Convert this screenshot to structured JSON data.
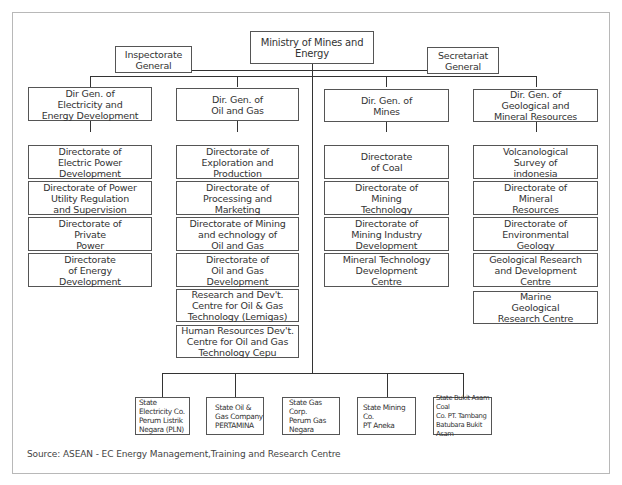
{
  "ministry": {
    "label": "Ministry of Mines and Energy"
  },
  "staff": {
    "inspectorate": "Inspectorate\nGeneral",
    "secretariat": "Secretariat\nGeneral"
  },
  "directorates_general": [
    {
      "label": "Dir Gen. of\nElectricity and\nEnergy Development",
      "units": [
        "Directorate of\nElectric Power\nDevelopment",
        "Directorate of Power\nUtility Regulation\nand Supervision",
        "Directorate of\nPrivate\nPower",
        "Directorate\nof Energy\nDevelopment"
      ]
    },
    {
      "label": "Dir. Gen. of\nOil and Gas",
      "units": [
        "Directorate of\nExploration and\nProduction",
        "Directorate of\nProcessing and\nMarketing",
        "Directorate of Mining\nand echnology of\nOil and Gas",
        "Directorate of\nOil and Gas\nDevelopment",
        "Research and Dev't.\nCentre for Oil & Gas\nTechnology (Lemigas)",
        "Human Resources Dev't.\nCentre for Oil and Gas\nTechnology Cepu"
      ]
    },
    {
      "label": "Dir. Gen. of\nMines",
      "units": [
        "Directorate\nof Coal",
        "Directorate of\nMining\nTechnology",
        "Directorate of\nMining Industry\nDevelopment",
        "Mineral Technology\nDevelopment\nCentre"
      ]
    },
    {
      "label": "Dir. Gen. of\nGeological and\nMineral Resources",
      "units": [
        "Volcanological\nSurvey of\nindonesia",
        "Directorate of\nMineral\nResources",
        "Directorate of\nEnvironmental\nGeology",
        "Geological Research\nand Development\nCentre",
        "Marine\nGeological\nResearch Centre"
      ]
    }
  ],
  "state_enterprises": [
    "State Electricity Co.\nPerum Listrik\nNegara (PLN)",
    "State Oil &\nGas Company\nPERTAMINA",
    "State Gas Corp.\nPerum Gas\nNegara",
    "State Mining Co.\n  PT Aneka",
    "State Bukit Asam Coal\nCo. PT. Tambang\nBatubara Bukit Asam"
  ],
  "source": "Source: ASEAN - EC Energy Management,Training and Research Centre"
}
